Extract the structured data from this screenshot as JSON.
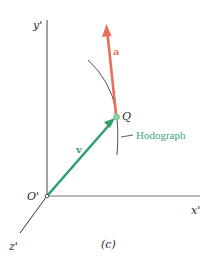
{
  "figure": {
    "caption": "(c)",
    "axes": {
      "y_label": "y'",
      "x_label": "x'",
      "z_label": "z'",
      "origin_label": "O'"
    },
    "point": {
      "label": "Q"
    },
    "vectors": {
      "velocity": {
        "label": "v",
        "color": "#2fa06e"
      },
      "acceleration": {
        "label": "a",
        "color": "#e8705a"
      }
    },
    "curve": {
      "label": "Hodograph",
      "label_color": "#3aa57c"
    },
    "colors": {
      "axis": "#444444",
      "curve": "#555555",
      "point_fill": "#8fd3a8",
      "background": "#ffffff"
    }
  }
}
